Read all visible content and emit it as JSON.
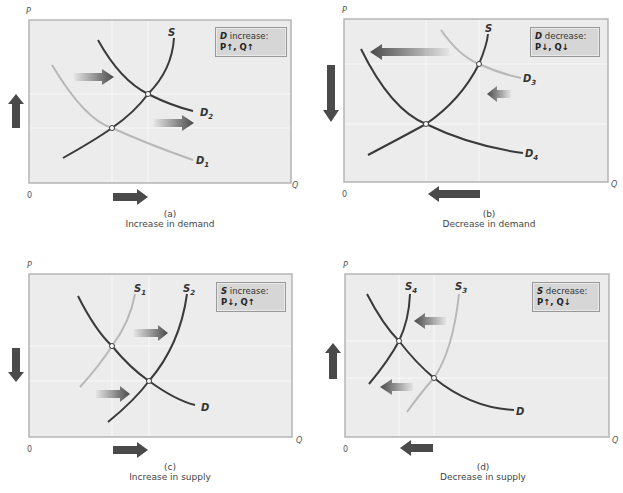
{
  "panels": [
    {
      "id": "a",
      "label": "(a)",
      "title": "Increase in demand",
      "box": {
        "subject": "D",
        "action": " increase:",
        "effect": "P↑, Q↑"
      },
      "axis": {
        "y": "P",
        "x": "Q",
        "origin": "0"
      },
      "curves": [
        {
          "name": "S",
          "label": "S",
          "color": "#3a3a3a"
        },
        {
          "name": "D1",
          "label": "D",
          "sub": "1",
          "color": "#b8b8b8"
        },
        {
          "name": "D2",
          "label": "D",
          "sub": "2",
          "color": "#3a3a3a"
        }
      ]
    },
    {
      "id": "b",
      "label": "(b)",
      "title": "Decrease in demand",
      "box": {
        "subject": "D",
        "action": " decrease:",
        "effect": "P↓, Q↓"
      },
      "axis": {
        "y": "P",
        "x": "Q",
        "origin": "0"
      },
      "curves": [
        {
          "name": "S",
          "label": "S",
          "color": "#3a3a3a"
        },
        {
          "name": "D3",
          "label": "D",
          "sub": "3",
          "color": "#b8b8b8"
        },
        {
          "name": "D4",
          "label": "D",
          "sub": "4",
          "color": "#3a3a3a"
        }
      ]
    },
    {
      "id": "c",
      "label": "(c)",
      "title": "Increase in supply",
      "box": {
        "subject": "S",
        "action": " increase:",
        "effect": "P↓, Q↑"
      },
      "axis": {
        "y": "P",
        "x": "Q",
        "origin": "0"
      },
      "curves": [
        {
          "name": "S1",
          "label": "S",
          "sub": "1",
          "color": "#b8b8b8"
        },
        {
          "name": "S2",
          "label": "S",
          "sub": "2",
          "color": "#3a3a3a"
        },
        {
          "name": "D",
          "label": "D",
          "color": "#3a3a3a"
        }
      ]
    },
    {
      "id": "d",
      "label": "(d)",
      "title": "Decrease in supply",
      "box": {
        "subject": "S",
        "action": " decrease:",
        "effect": "P↑, Q↓"
      },
      "axis": {
        "y": "P",
        "x": "Q",
        "origin": "0"
      },
      "curves": [
        {
          "name": "S4",
          "label": "S",
          "sub": "4",
          "color": "#3a3a3a"
        },
        {
          "name": "S3",
          "label": "S",
          "sub": "3",
          "color": "#b8b8b8"
        },
        {
          "name": "D",
          "label": "D",
          "color": "#3a3a3a"
        }
      ]
    }
  ],
  "colors": {
    "plot_bg": "#ececec",
    "plot_border": "#b5b5b5",
    "dark_curve": "#3a3a3a",
    "light_curve": "#b8b8b8",
    "arrow": "#4a4a4a",
    "box_bg": "#d6d6d6"
  }
}
